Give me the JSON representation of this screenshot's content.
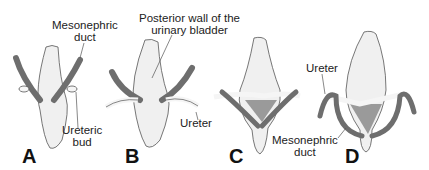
{
  "diagram": {
    "panels": [
      {
        "id": "A",
        "label": "A"
      },
      {
        "id": "B",
        "label": "B"
      },
      {
        "id": "C",
        "label": "C"
      },
      {
        "id": "D",
        "label": "D"
      }
    ],
    "annotations": {
      "mesonephric_duct_a_line1": "Mesonephric",
      "mesonephric_duct_a_line2": "duct",
      "ureteric_bud_line1": "Ureteric",
      "ureteric_bud_line2": "bud",
      "posterior_wall_line1": "Posterior wall of the",
      "posterior_wall_line2": "urinary bladder",
      "ureter_b": "Ureter",
      "ureter_d": "Ureter",
      "mesonephric_duct_d_line1": "Mesonephric",
      "mesonephric_duct_d_line2": "duct"
    },
    "colors": {
      "duct": "#6e6e6e",
      "bladder": "#f0f0f0",
      "trigone": "#9a9a9a",
      "outline": "#555555"
    }
  }
}
